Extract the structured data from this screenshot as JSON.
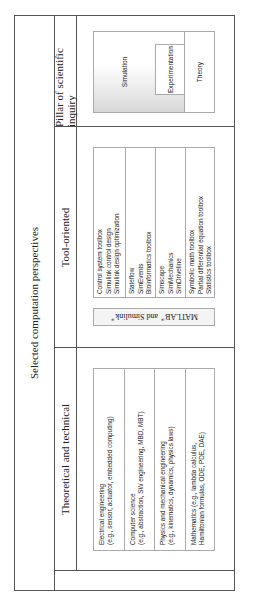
{
  "title": "Selected computation perspectives",
  "columns": {
    "theoretical": {
      "header": "Theoretical and technical",
      "items": [
        {
          "line1": "Electrical engineering",
          "line2": "(e.g., sensor, actuator, embedded computing)"
        },
        {
          "line1": "Computer science",
          "line2": "(e.g., abstraction, SW engineering, MBD, MBT)"
        },
        {
          "line1": "Physics and mechanical engineering",
          "line2": "(e.g., kinematics, dynamics, physics laws)"
        },
        {
          "line1": "Mathematics (e.g., lambda calculus,",
          "line2": "Hamiltonian formulas, ODE, PDE, DAE)"
        }
      ]
    },
    "tool": {
      "header": "Tool-oriented",
      "platform": {
        "name1": "MATLAB",
        "reg1": "®",
        "joiner": " and Simulink",
        "reg2": "®"
      },
      "groups": [
        [
          "Control system toolbox",
          "Simulink control design",
          "Simulink design optimization"
        ],
        [
          "Stateflow",
          "SimEvents",
          "Bioinformatics toolbox"
        ],
        [
          "Simscape",
          "SimMechanics",
          "SimDriveline"
        ],
        [
          "Symbolic math toolbox",
          "Partial differential equation toolbox",
          "Statistics toolbox"
        ]
      ]
    },
    "pillar": {
      "header": "Pillar of scientific inquiry",
      "labels": {
        "simulation": "Simulation",
        "experimentation": "Experimentation",
        "theory": "Theory"
      }
    }
  },
  "colors": {
    "line": "#555555",
    "box_border": "#aaaaaa",
    "shade": "#d8d8d8"
  }
}
